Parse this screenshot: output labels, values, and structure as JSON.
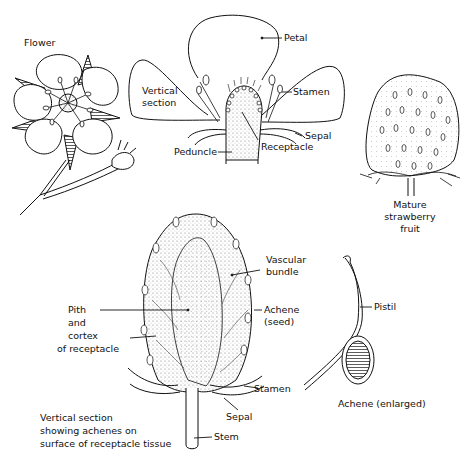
{
  "diagram": {
    "panels": {
      "flower": {
        "title": "Flower"
      },
      "vertical_section": {
        "title_line1": "Vertical",
        "title_line2": "section",
        "labels": {
          "petal": "Petal",
          "stamen": "Stamen",
          "sepal": "Sepal",
          "receptacle": "Receptacle",
          "peduncle": "Peduncle"
        }
      },
      "mature_fruit": {
        "line1": "Mature",
        "line2": "strawberry",
        "line3": "fruit"
      },
      "fruit_section": {
        "labels": {
          "vascular_line1": "Vascular",
          "vascular_line2": "bundle",
          "achene_line1": "Achene",
          "achene_line2": "(seed)",
          "pith_line1": "Pith",
          "pith_line2": "and",
          "pith_line3": "cortex",
          "pith_line4": "of receptacle",
          "stamen": "Stamen",
          "sepal": "Sepal",
          "stem": "Stem"
        },
        "caption_line1": "Vertical section",
        "caption_line2": "showing achenes on",
        "caption_line3": "surface of receptacle tissue"
      },
      "achene_enlarged": {
        "pistil": "Pistil",
        "caption": "Achene (enlarged)"
      }
    },
    "colors": {
      "ink": "#111111",
      "background": "#ffffff",
      "stipple": "#bdbdbd"
    }
  }
}
